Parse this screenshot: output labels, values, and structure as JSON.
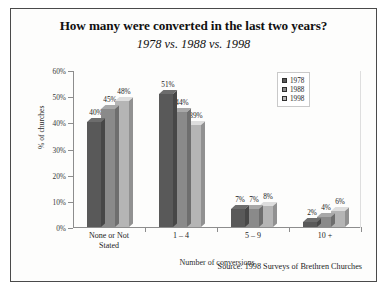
{
  "chart_data": {
    "type": "bar",
    "title": "How many were converted in the last two years?",
    "subtitle": "1978 vs. 1988 vs. 1998",
    "xlabel": "Number of conversions",
    "ylabel": "% of churches",
    "categories": [
      "None or Not\nStated",
      "1 – 4",
      "5 – 9",
      "10 +"
    ],
    "series": [
      {
        "name": "1978",
        "values": [
          40,
          51,
          7,
          2
        ],
        "color": "#595959"
      },
      {
        "name": "1988",
        "values": [
          45,
          44,
          7,
          4
        ],
        "color": "#8a8a8a"
      },
      {
        "name": "1998",
        "values": [
          48,
          39,
          8,
          6
        ],
        "color": "#b5b5b5"
      }
    ],
    "value_labels": [
      [
        "40%",
        "45%",
        "48%"
      ],
      [
        "51%",
        "44%",
        "39%"
      ],
      [
        "7%",
        "7%",
        "8%"
      ],
      [
        "2%",
        "4%",
        "6%"
      ]
    ],
    "ylim": [
      0,
      60
    ],
    "yticks": [
      0,
      10,
      20,
      30,
      40,
      50,
      60
    ],
    "ytick_labels": [
      "0%",
      "10%",
      "20%",
      "30%",
      "40%",
      "50%",
      "60%"
    ],
    "grid": false,
    "legend_position": "top-right",
    "source": "Source: 1998 Surveys of Brethren Churches"
  }
}
